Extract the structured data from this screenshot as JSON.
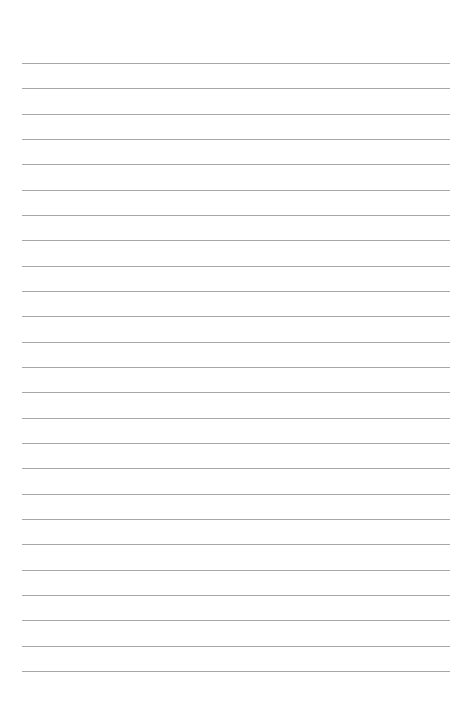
{
  "page": {
    "type": "lined-paper",
    "background_color": "#ffffff",
    "line_color": "#a8a8a8",
    "line_count": 25,
    "first_line_y": 63,
    "line_spacing": 25.33,
    "line_left": 22,
    "line_width": 428,
    "text_content": ""
  }
}
